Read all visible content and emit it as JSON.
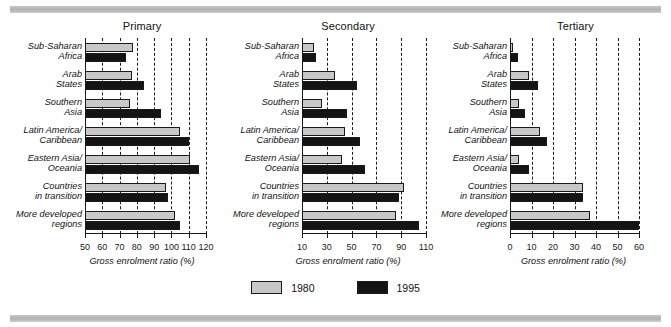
{
  "figure": {
    "legend": {
      "position": "bottom-center",
      "entries": [
        {
          "label": "1980",
          "color": "#c8c8c8",
          "key": "y1980"
        },
        {
          "label": "1995",
          "color": "#141414",
          "key": "y1995"
        }
      ]
    }
  },
  "chart_data": [
    {
      "type": "bar",
      "orientation": "horizontal",
      "title": "Primary",
      "xlabel": "Gross enrolment ratio (%)",
      "ylabel": "",
      "xlim": [
        50,
        120
      ],
      "xticks": [
        50,
        60,
        70,
        80,
        90,
        100,
        110,
        120
      ],
      "grid": "vertical-dashed",
      "categories": [
        "Sub-Saharan\nAfrica",
        "Arab\nStates",
        "Southern\nAsia",
        "Latin America/\nCaribbean",
        "Eastern Asia/\nOceania",
        "Countries\nin transition",
        "More developed\nregions"
      ],
      "series": [
        {
          "name": "1980",
          "values": [
            78,
            77,
            76,
            105,
            111,
            97,
            102
          ]
        },
        {
          "name": "1995",
          "values": [
            74,
            84,
            94,
            110,
            116,
            98,
            105
          ]
        }
      ]
    },
    {
      "type": "bar",
      "orientation": "horizontal",
      "title": "Secondary",
      "xlabel": "Gross enrolment ratio (%)",
      "ylabel": "",
      "xlim": [
        10,
        110
      ],
      "xticks": [
        10,
        30,
        50,
        70,
        90,
        110
      ],
      "grid": "vertical-dashed",
      "categories": [
        "Sub-Saharan\nAfrica",
        "Arab\nStates",
        "Southern\nAsia",
        "Latin America/\nCaribbean",
        "Eastern Asia/\nOceania",
        "Countries\nin transition",
        "More developed\nregions"
      ],
      "series": [
        {
          "name": "1980",
          "values": [
            20,
            37,
            26,
            45,
            42,
            92,
            86
          ]
        },
        {
          "name": "1995",
          "values": [
            21,
            54,
            46,
            57,
            61,
            88,
            104
          ]
        }
      ]
    },
    {
      "type": "bar",
      "orientation": "horizontal",
      "title": "Tertiary",
      "xlabel": "Gross enrolment ratio (%)",
      "ylabel": "",
      "xlim": [
        0,
        60
      ],
      "xticks": [
        0,
        10,
        20,
        30,
        40,
        50,
        60
      ],
      "grid": "vertical-dashed",
      "categories": [
        "Sub-Saharan\nAfrica",
        "Arab\nStates",
        "Southern\nAsia",
        "Latin America/\nCaribbean",
        "Eastern Asia/\nOceania",
        "Countries\nin transition",
        "More developed\nregions"
      ],
      "series": [
        {
          "name": "1980",
          "values": [
            1.5,
            9,
            4,
            14,
            4,
            34,
            37
          ]
        },
        {
          "name": "1995",
          "values": [
            3.5,
            13,
            7,
            17,
            9,
            34,
            60
          ]
        }
      ]
    }
  ]
}
